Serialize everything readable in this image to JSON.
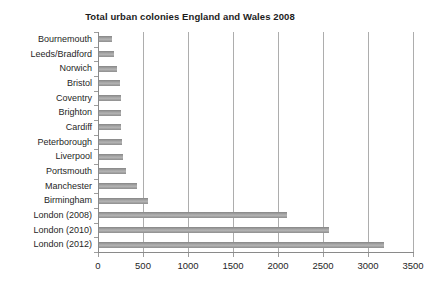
{
  "title": "Total urban colonies England and Wales 2008",
  "chart_data": {
    "type": "bar",
    "orientation": "horizontal",
    "title": "Total urban colonies England and Wales 2008",
    "categories": [
      "Bournemouth",
      "Leeds/Bradford",
      "Norwich",
      "Bristol",
      "Coventry",
      "Brighton",
      "Cardiff",
      "Peterborough",
      "Liverpool",
      "Portsmouth",
      "Manchester",
      "Birmingham",
      "London (2008)",
      "London (2010)",
      "London (2012)"
    ],
    "values": [
      140,
      165,
      195,
      230,
      240,
      245,
      245,
      255,
      270,
      305,
      420,
      540,
      2090,
      2560,
      3170
    ],
    "xlabel": "",
    "ylabel": "",
    "xlim": [
      0,
      3500
    ],
    "xticks": [
      0,
      500,
      1000,
      1500,
      2000,
      2500,
      3000,
      3500
    ],
    "grid": true,
    "legend": "none",
    "bar_color": "#9e9e9e",
    "gridline_color": "#adadad",
    "axis_color": "#8a8a8a",
    "text_color": "#262626"
  }
}
